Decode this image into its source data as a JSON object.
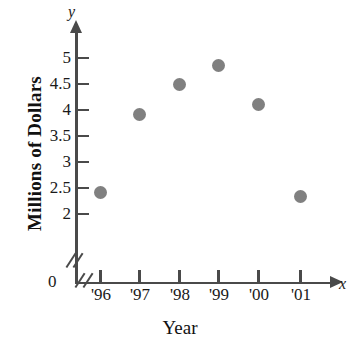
{
  "chart_data": {
    "type": "scatter",
    "title": "",
    "xlabel": "Year",
    "ylabel": "Millions of Dollars",
    "x_var": "x",
    "y_var": "y",
    "categories": [
      "'96",
      "'97",
      "'98",
      "'99",
      "'00",
      "'01"
    ],
    "values": [
      2.4,
      3.9,
      4.49,
      4.85,
      4.1,
      2.33
    ],
    "series": [
      {
        "name": "Revenue",
        "points": [
          {
            "x": "'96",
            "y": 2.4
          },
          {
            "x": "'97",
            "y": 3.9
          },
          {
            "x": "'98",
            "y": 4.49
          },
          {
            "x": "'99",
            "y": 4.85
          },
          {
            "x": "'00",
            "y": 4.1
          },
          {
            "x": "'01",
            "y": 2.33
          }
        ]
      }
    ],
    "y_ticks": [
      5,
      4.5,
      4,
      3.5,
      3,
      2.5,
      2
    ],
    "y_tick_labels": [
      "5",
      "4.5",
      "4",
      "3.5",
      "3",
      "2.5",
      "2"
    ],
    "origin_label": "0",
    "ylim": [
      2,
      5
    ],
    "axis_break": true,
    "grid": false,
    "legend": false,
    "marker_color": "#808080",
    "axis_color": "#4a4a4a",
    "text_color": "#1a1a1a"
  },
  "labels": {
    "y_axis_title": "Millions of Dollars",
    "x_axis_title": "Year",
    "y_axis_variable": "y",
    "x_axis_variable": "x",
    "origin": "0",
    "y0": "5",
    "y1": "4.5",
    "y2": "4",
    "y3": "3.5",
    "y4": "3",
    "y5": "2.5",
    "y6": "2",
    "x0": "'96",
    "x1": "'97",
    "x2": "'98",
    "x3": "'99",
    "x4": "'00",
    "x5": "'01"
  }
}
